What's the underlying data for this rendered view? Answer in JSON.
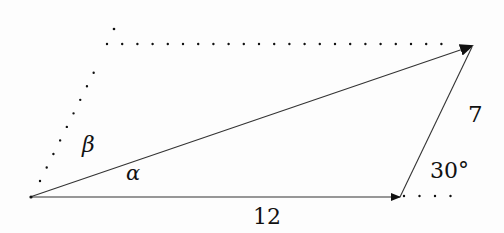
{
  "diagram": {
    "type": "vector-addition-triangle",
    "colors": {
      "line": "#222222",
      "dots": "#111111",
      "background": "#fdfdfd",
      "text": "#111111"
    },
    "vectors": [
      {
        "name": "bottom-vector",
        "from": [
          30,
          197
        ],
        "to": [
          400,
          197
        ],
        "label": "12"
      },
      {
        "name": "slanted-vector",
        "from": [
          400,
          197
        ],
        "to": [
          473,
          46
        ],
        "label": "7"
      },
      {
        "name": "resultant-vector",
        "from": [
          30,
          197
        ],
        "to": [
          473,
          46
        ],
        "label": ""
      }
    ],
    "dotted_guides": [
      {
        "name": "horizontal-top-guide",
        "from": [
          107,
          44
        ],
        "to": [
          451,
          44
        ]
      },
      {
        "name": "slanted-left-guide",
        "from": [
          40,
          181
        ],
        "to": [
          107,
          44
        ]
      },
      {
        "name": "bottom-extension-guide",
        "from": [
          404,
          196
        ],
        "to": [
          451,
          196
        ]
      }
    ],
    "labels": {
      "bottom_length": "12",
      "side_length": "7",
      "angle_exterior": "30°",
      "angle_alpha": "α",
      "angle_beta": "β"
    }
  }
}
